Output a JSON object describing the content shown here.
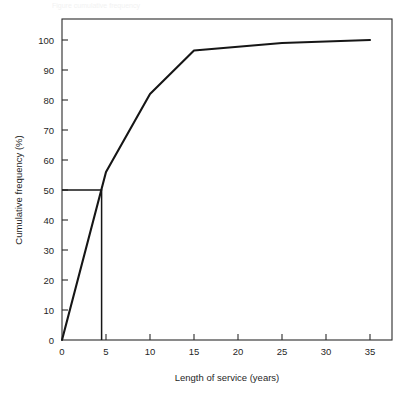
{
  "figure": {
    "ghost_caption": "Figure    cumulative frequency",
    "background_color": "#ffffff",
    "curve_color": "#161616",
    "axis_color": "#2b2b2b"
  },
  "chart_data": {
    "type": "line",
    "title": "",
    "subtitle": "",
    "xlabel": "Length of service (years)",
    "ylabel": "Cumulative frequency (%)",
    "xlim": [
      0,
      37.5
    ],
    "ylim": [
      0,
      107
    ],
    "grid": false,
    "legend": null,
    "x_ticks": [
      0,
      5,
      10,
      15,
      20,
      25,
      30,
      35
    ],
    "x_tick_labels": [
      "0",
      "5",
      "10",
      "15",
      "20",
      "25",
      "30",
      "35"
    ],
    "y_ticks": [
      0,
      10,
      20,
      30,
      40,
      50,
      60,
      70,
      80,
      90,
      100
    ],
    "y_tick_labels": [
      "0",
      "10",
      "20",
      "30",
      "40",
      "50",
      "60",
      "70",
      "80",
      "90",
      "100"
    ],
    "series": [
      {
        "name": "Cumulative frequency",
        "x": [
          0,
          5,
          10,
          15,
          25,
          35
        ],
        "values": [
          0,
          56,
          82,
          96.5,
          99,
          100
        ]
      }
    ],
    "annotations": [
      {
        "name": "median-guide",
        "kind": "polyline",
        "label": "Median read-off at 50%",
        "points": [
          {
            "x": 0,
            "y": 50
          },
          {
            "x": 4.5,
            "y": 50
          },
          {
            "x": 4.5,
            "y": 0
          }
        ]
      }
    ]
  }
}
